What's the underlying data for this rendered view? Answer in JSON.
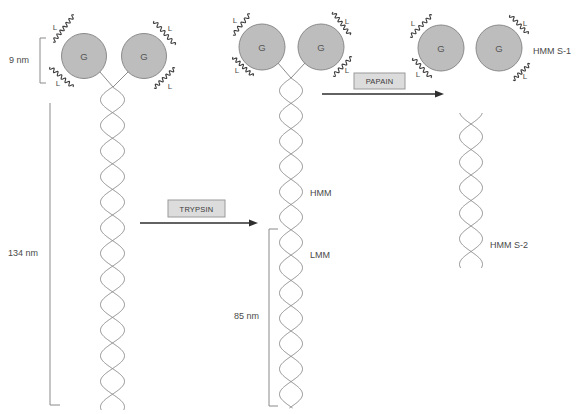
{
  "intact_myosin": {
    "heads": [
      {
        "label": "G",
        "light_chains": [
          "L",
          "L"
        ]
      },
      {
        "label": "G",
        "light_chains": [
          "L",
          "L"
        ]
      }
    ],
    "head_size_label": "9 nm",
    "length_label": "134 nm"
  },
  "trypsin_step": {
    "enzyme": "TRYPSIN"
  },
  "hmm_lmm": {
    "heads": [
      {
        "label": "G",
        "light_chains": [
          "L",
          "L"
        ]
      },
      {
        "label": "G",
        "light_chains": [
          "L",
          "L"
        ]
      }
    ],
    "hmm_label": "HMM",
    "lmm_label": "LMM",
    "lmm_length_label": "85 nm"
  },
  "papain_step": {
    "enzyme": "PAPAIN"
  },
  "fragments": {
    "heads": [
      {
        "label": "G",
        "light_chains": [
          "L",
          "L"
        ]
      },
      {
        "label": "G",
        "light_chains": [
          "L",
          "L"
        ]
      }
    ],
    "s1_label": "HMM S-1",
    "s2_label": "HMM S-2"
  }
}
